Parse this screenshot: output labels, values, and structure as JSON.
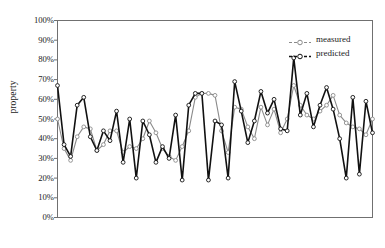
{
  "chart_data": {
    "type": "line",
    "title": "",
    "xlabel": "",
    "ylabel": "property",
    "ylim": [
      0,
      100
    ],
    "yticks": [
      "0%",
      "10%",
      "20%",
      "30%",
      "40%",
      "50%",
      "60%",
      "70%",
      "80%",
      "90%",
      "100%"
    ],
    "ytick_values": [
      0,
      10,
      20,
      30,
      40,
      50,
      60,
      70,
      80,
      90,
      100
    ],
    "xlim": [
      1,
      49
    ],
    "xticks": [],
    "grid": false,
    "frame": true,
    "legend_position": "upper right",
    "marker": "circle-open",
    "x": [
      1,
      2,
      3,
      4,
      5,
      6,
      7,
      8,
      9,
      10,
      11,
      12,
      13,
      14,
      15,
      16,
      17,
      18,
      19,
      20,
      21,
      22,
      23,
      24,
      25,
      26,
      27,
      28,
      29,
      30,
      31,
      32,
      33,
      34,
      35,
      36,
      37,
      38,
      39,
      40,
      41,
      42,
      43,
      44,
      45,
      46,
      47,
      48,
      49
    ],
    "series": [
      {
        "name": "measured",
        "color": "#8a8a8a",
        "values": [
          50,
          35,
          29,
          41,
          46,
          45,
          34,
          37,
          44,
          44,
          33,
          36,
          35,
          40,
          49,
          43,
          35,
          31,
          29,
          36,
          44,
          61,
          63,
          63,
          62,
          44,
          33,
          56,
          55,
          46,
          40,
          56,
          47,
          55,
          43,
          50,
          67,
          57,
          52,
          50,
          54,
          57,
          62,
          52,
          48,
          46,
          45,
          42,
          50
        ]
      },
      {
        "name": "predicted",
        "color": "#111111",
        "values": [
          67,
          37,
          31,
          57,
          61,
          41,
          34,
          44,
          39,
          54,
          28,
          50,
          20,
          49,
          42,
          28,
          36,
          30,
          52,
          19,
          57,
          63,
          63,
          19,
          49,
          47,
          20,
          69,
          54,
          38,
          49,
          64,
          53,
          60,
          45,
          44,
          81,
          52,
          63,
          46,
          57,
          66,
          55,
          40,
          20,
          61,
          22,
          59,
          43
        ]
      }
    ]
  },
  "legend": {
    "entries": [
      {
        "label": "measured",
        "color": "#8a8a8a",
        "dash": "3 2"
      },
      {
        "label": "predicted",
        "color": "#111111",
        "dash": "3 2"
      }
    ]
  }
}
